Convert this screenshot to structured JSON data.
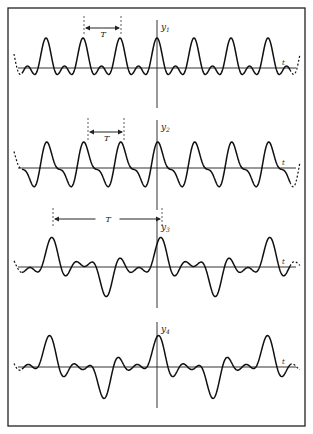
{
  "figure": {
    "frame": {
      "x": 8,
      "y": 8,
      "w": 297,
      "h": 418,
      "stroke": "#222222"
    },
    "vertical_axis_x": 157,
    "curve_color": "#111111",
    "axis_color": "#333333",
    "axis_x_start": 18,
    "axis_x_end": 296,
    "curve_x_start": 22,
    "curve_x_end": 290
  },
  "panels": [
    {
      "id": "y1",
      "label": "y",
      "subscript": "1",
      "t_label": "t",
      "baseline": 68,
      "axis_top": 20,
      "axis_bottom": 108,
      "period_px": 37,
      "phase_x": 157,
      "harmonics": [
        [
          1,
          14,
          0
        ],
        [
          2,
          10,
          0
        ]
      ],
      "offset": 6,
      "period_marker": {
        "x1": 84,
        "x2": 121,
        "y": 28,
        "label": "T",
        "dash_top": 16,
        "dash_bottom": 34
      }
    },
    {
      "id": "y2",
      "label": "y",
      "subscript": "2",
      "t_label": "t",
      "baseline": 168,
      "axis_top": 120,
      "axis_bottom": 210,
      "period_px": 37,
      "phase_x": 160,
      "harmonics": [
        [
          1,
          18,
          0
        ],
        [
          2,
          8,
          1.2
        ]
      ],
      "offset": 2,
      "period_marker": {
        "x1": 88,
        "x2": 124,
        "y": 132,
        "label": "T",
        "dash_top": 118,
        "dash_bottom": 140
      }
    },
    {
      "id": "y3",
      "label": "y",
      "subscript": "3",
      "t_label": "t",
      "baseline": 267,
      "axis_top": 220,
      "axis_bottom": 308,
      "period_px": 109,
      "phase_x": 162,
      "harmonics": [
        [
          1,
          10,
          0
        ],
        [
          3,
          12,
          0.4
        ],
        [
          5,
          8,
          0.2
        ]
      ],
      "offset": 0,
      "period_marker": {
        "x1": 53,
        "x2": 162,
        "y": 219,
        "label": "T",
        "dash_top": 208,
        "dash_bottom": 226
      }
    },
    {
      "id": "y4",
      "label": "y",
      "subscript": "4",
      "t_label": "t",
      "baseline": 367,
      "axis_top": 322,
      "axis_bottom": 408,
      "period_px": 109,
      "phase_x": 161,
      "harmonics": [
        [
          1,
          12,
          0.3
        ],
        [
          3,
          12,
          0.6
        ],
        [
          5,
          8,
          0.5
        ]
      ],
      "offset": 0,
      "period_marker": null
    }
  ]
}
